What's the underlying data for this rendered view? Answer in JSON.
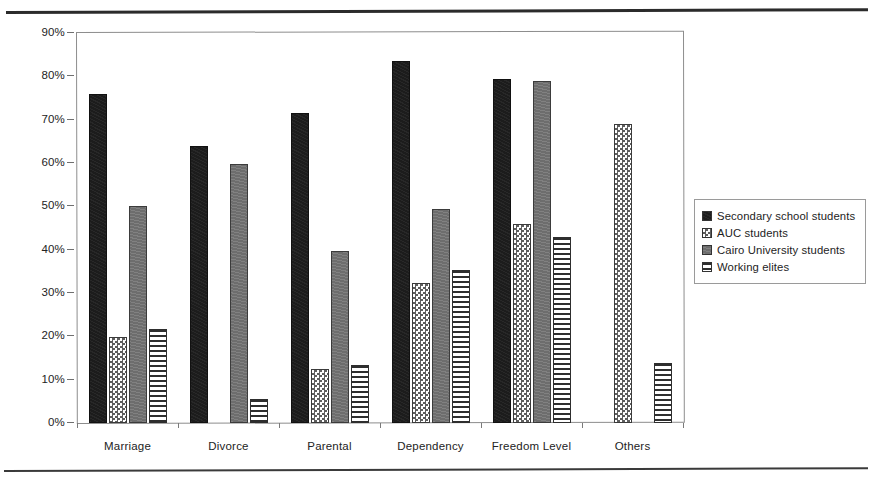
{
  "chart_data": {
    "type": "bar",
    "title": "",
    "xlabel": "",
    "ylabel": "",
    "ylim": [
      0,
      90
    ],
    "grid": false,
    "legend_position": "right",
    "categories": [
      "Marriage",
      "Divorce",
      "Parental",
      "Dependency",
      "Freedom Level",
      "Others"
    ],
    "ytick_labels": [
      "90%",
      "80%",
      "70%",
      "60%",
      "50%",
      "40%",
      "30%",
      "20%",
      "10%",
      "0%"
    ],
    "ytick_values": [
      90,
      80,
      70,
      60,
      50,
      40,
      30,
      20,
      10,
      0
    ],
    "series": [
      {
        "name": "Secondary school students",
        "pattern": "solid-black",
        "color": "#1c1c1c",
        "values": [
          76.0,
          63.9,
          71.6,
          83.5,
          79.4,
          0
        ]
      },
      {
        "name": "AUC students",
        "pattern": "checker",
        "color": "#5e5e5e",
        "values": [
          19.9,
          0,
          12.4,
          32.4,
          46.0,
          68.9
        ]
      },
      {
        "name": "Cairo University students",
        "pattern": "solid-gray",
        "color": "#737373",
        "values": [
          50.0,
          59.7,
          39.6,
          49.4,
          79.0,
          0
        ]
      },
      {
        "name": "Working elites",
        "pattern": "hstripe",
        "color": "#2e2e2e",
        "values": [
          21.7,
          5.5,
          13.4,
          35.2,
          43.0,
          13.9
        ]
      }
    ]
  },
  "legend": {
    "items": [
      {
        "label": "Secondary school students",
        "pattern": "solid-black"
      },
      {
        "label": "AUC students",
        "pattern": "checker"
      },
      {
        "label": "Cairo University students",
        "pattern": "solid-gray"
      },
      {
        "label": "Working elites",
        "pattern": "hstripe"
      }
    ]
  }
}
